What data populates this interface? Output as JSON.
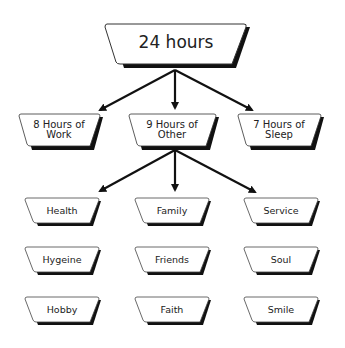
{
  "root": {
    "label": "24 hours"
  },
  "level1": [
    {
      "label": "8 Hours of Work"
    },
    {
      "label": "9 Hours of Other"
    },
    {
      "label": "7 Hours of Sleep"
    }
  ],
  "level2": [
    {
      "label": "Health"
    },
    {
      "label": "Family"
    },
    {
      "label": "Service"
    },
    {
      "label": "Hygeine"
    },
    {
      "label": "Friends"
    },
    {
      "label": "Soul"
    },
    {
      "label": "Hobby"
    },
    {
      "label": "Faith"
    },
    {
      "label": "Smile"
    }
  ],
  "colors": {
    "stroke": "#111111",
    "fill": "#ffffff",
    "shadow": "#111111"
  }
}
